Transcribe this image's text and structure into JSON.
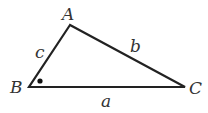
{
  "diagram": {
    "vertices": {
      "A": {
        "label": "A",
        "x": 70,
        "y": 25
      },
      "B": {
        "label": "B",
        "x": 29,
        "y": 87
      },
      "C": {
        "label": "C",
        "x": 185,
        "y": 87
      }
    },
    "sides": {
      "a": {
        "label": "a",
        "from": "B",
        "to": "C"
      },
      "b": {
        "label": "b",
        "from": "A",
        "to": "C"
      },
      "c": {
        "label": "c",
        "from": "A",
        "to": "B"
      }
    },
    "right_angle_marker": {
      "vertex": "B",
      "style": "dot"
    },
    "stroke_color": "#222222"
  }
}
